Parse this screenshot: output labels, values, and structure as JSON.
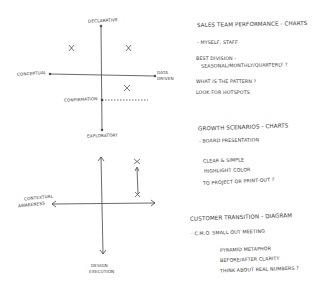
{
  "sketch_top": {
    "axes": {
      "top": "Declarative",
      "bottom": "Exploratory",
      "left": "Conceptual",
      "right_line1": "Data",
      "right_line2": "Driven",
      "threshold": "Confirmation"
    },
    "marks": [
      "x",
      "x",
      "x"
    ]
  },
  "sketch_bottom": {
    "axes": {
      "left_line1": "Contextual",
      "left_line2": "Awareness",
      "bottom_line1": "Design",
      "bottom_line2": "Execution"
    },
    "marks": [
      "x",
      "x"
    ]
  },
  "notes": [
    {
      "title": "Sales team performance - charts",
      "lines": [
        "- myself, staff",
        "Best division -",
        "seasonal/monthly/quarterly ?",
        "What is the pattern ?",
        "Look for hotspots"
      ]
    },
    {
      "title": "Growth scenarios - charts",
      "lines": [
        "- Board presentation",
        "Clear & simple",
        "highlight color",
        "To project or print-out ?"
      ]
    },
    {
      "title": "Customer transition - diagram",
      "lines": [
        "- C.M.O. small out meeting",
        "Pyramid metaphor",
        "before/after clarity",
        "think about real numbers ?"
      ]
    }
  ],
  "colors": {
    "ink": "#3a3a3a",
    "paper": "#ffffff"
  }
}
